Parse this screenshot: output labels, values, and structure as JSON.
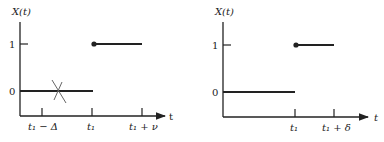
{
  "figure": {
    "left_plot": {
      "y_axis_label": "X(t)",
      "x_axis_label": "t",
      "y_ticks": [
        "1",
        "0"
      ],
      "x_ticks": [
        "t₁ − Δ",
        "t₁",
        "t₁ + ν"
      ],
      "segments": [
        {
          "level": 0,
          "from": "0",
          "to": "t1"
        },
        {
          "level": 1,
          "from": "t1",
          "to": "t1 + ν",
          "closed_dot_at_start": true
        }
      ],
      "annotation": "crossed-out mark on level 0 near t1 - Δ"
    },
    "right_plot": {
      "y_axis_label": "X(t)",
      "x_axis_label": "t",
      "y_ticks": [
        "1",
        "0"
      ],
      "x_ticks": [
        "t₁",
        "t₁ + δ"
      ],
      "segments": [
        {
          "level": 0,
          "from": "0",
          "to": "t1"
        },
        {
          "level": 1,
          "from": "t1",
          "to": "t1 + δ",
          "closed_dot_at_start": true
        }
      ]
    },
    "colors": {
      "ink": "#222222",
      "cross_mark": "#666666",
      "background": "#ffffff"
    }
  }
}
